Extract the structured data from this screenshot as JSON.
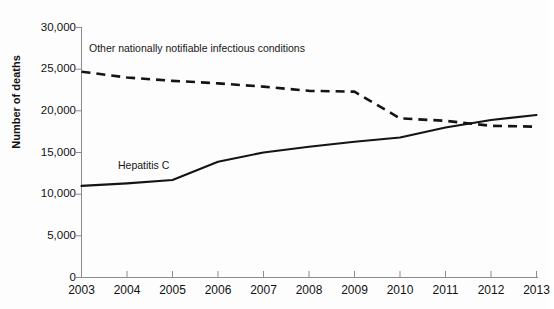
{
  "chart_data": {
    "type": "line",
    "title": "",
    "xlabel": "",
    "ylabel": "Number of deaths",
    "x": [
      2003,
      2004,
      2005,
      2006,
      2007,
      2008,
      2009,
      2010,
      2011,
      2012,
      2013
    ],
    "xticklabels": [
      "2003",
      "2004",
      "2005",
      "2006",
      "2007",
      "2008",
      "2009",
      "2010",
      "2011",
      "2012",
      "2013"
    ],
    "yticklabels": [
      "0",
      "5,000",
      "10,000",
      "15,000",
      "20,000",
      "25,000",
      "30,000"
    ],
    "yticks": [
      0,
      5000,
      10000,
      15000,
      20000,
      25000,
      30000
    ],
    "ylim": [
      0,
      30000
    ],
    "xlim": [
      2003,
      2013
    ],
    "grid": false,
    "legend_position": "inline-annotation",
    "series": [
      {
        "name": "Other nationally notifiable infectious conditions",
        "style": "dashed",
        "values": [
          24700,
          24000,
          23600,
          23300,
          22900,
          22400,
          22300,
          19100,
          18800,
          18200,
          18100
        ]
      },
      {
        "name": "Hepatitis C",
        "style": "solid",
        "values": [
          11000,
          11300,
          11700,
          13900,
          15000,
          15700,
          16300,
          16800,
          18000,
          18900,
          19500
        ]
      }
    ],
    "annotations": [
      {
        "text": "Other nationally notifiable infectious conditions",
        "series": "Other nationally notifiable infectious conditions"
      },
      {
        "text": "Hepatitis C",
        "series": "Hepatitis C"
      }
    ],
    "colors": {
      "line": "#141414",
      "axis": "#8c8c8c",
      "background": "#fdfdfd",
      "text": "#111111"
    }
  }
}
